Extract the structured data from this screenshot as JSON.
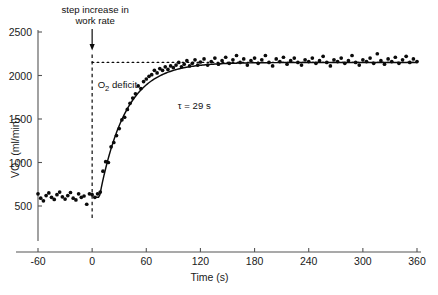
{
  "chart_data": {
    "type": "scatter",
    "title": "",
    "xlabel": "Time (s)",
    "ylabel": "VO2 (ml/min)",
    "ylabel_parts": {
      "main": "VO",
      "subscript": "2",
      "unit": " (ml/min)"
    },
    "xlim": [
      -60,
      360
    ],
    "ylim": [
      350,
      2560
    ],
    "xticks": [
      -60,
      0,
      60,
      120,
      180,
      240,
      300,
      360
    ],
    "xticklabels": [
      "-60",
      "0",
      "60",
      "120",
      "180",
      "240",
      "300",
      "360"
    ],
    "yticks": [
      500,
      1000,
      1500,
      2000,
      2500
    ],
    "yticklabels": [
      "500",
      "1000",
      "1500",
      "2000",
      "2500"
    ],
    "grid": false,
    "legend": false,
    "baseline_vo2": 600,
    "asymptote_vo2": 2150,
    "amplitude_vo2": 1550,
    "tau_seconds": 29,
    "time_delay_seconds": 8,
    "onset_time": 0,
    "series": [
      {
        "name": "VO2 breath-by-breath",
        "marker": "filled-circle",
        "color": "#0b0b0b",
        "x": [
          -60,
          -57,
          -54,
          -51,
          -48,
          -45,
          -42,
          -39,
          -36,
          -33,
          -30,
          -27,
          -24,
          -21,
          -18,
          -15,
          -12,
          -9,
          -6,
          -3,
          0,
          3,
          6,
          9,
          12,
          15,
          18,
          21,
          24,
          27,
          30,
          33,
          36,
          39,
          42,
          45,
          48,
          51,
          54,
          57,
          60,
          63,
          66,
          69,
          72,
          75,
          78,
          81,
          84,
          87,
          90,
          93,
          96,
          99,
          102,
          105,
          108,
          111,
          114,
          117,
          120,
          124,
          128,
          132,
          136,
          140,
          144,
          148,
          152,
          156,
          160,
          164,
          168,
          172,
          176,
          180,
          184,
          188,
          192,
          196,
          200,
          204,
          208,
          212,
          216,
          220,
          224,
          228,
          232,
          236,
          240,
          244,
          248,
          252,
          256,
          260,
          264,
          268,
          272,
          276,
          280,
          284,
          288,
          292,
          296,
          300,
          304,
          308,
          312,
          316,
          320,
          324,
          328,
          332,
          336,
          340,
          344,
          348,
          352,
          356,
          360
        ],
        "y": [
          640,
          590,
          560,
          620,
          650,
          600,
          575,
          630,
          660,
          605,
          580,
          620,
          655,
          590,
          570,
          640,
          600,
          615,
          520,
          640,
          630,
          600,
          640,
          660,
          900,
          1010,
          1000,
          1180,
          1230,
          1310,
          1390,
          1490,
          1520,
          1610,
          1680,
          1740,
          1790,
          1880,
          1850,
          1930,
          1960,
          1990,
          2010,
          2060,
          2030,
          2080,
          2060,
          2100,
          2070,
          2110,
          2090,
          2120,
          2150,
          2100,
          2130,
          2170,
          2110,
          2140,
          2180,
          2120,
          2155,
          2190,
          2120,
          2160,
          2200,
          2130,
          2170,
          2210,
          2140,
          2180,
          2230,
          2150,
          2190,
          2120,
          2170,
          2200,
          2140,
          2180,
          2230,
          2150,
          2110,
          2190,
          2160,
          2210,
          2130,
          2170,
          2200,
          2150,
          2120,
          2180,
          2160,
          2200,
          2140,
          2170,
          2220,
          2150,
          2110,
          2180,
          2160,
          2200,
          2140,
          2170,
          2230,
          2150,
          2120,
          2180,
          2160,
          2200,
          2140,
          2250,
          2170,
          2130,
          2190,
          2160,
          2210,
          2140,
          2180,
          2220,
          2150,
          2190,
          2160
        ]
      }
    ],
    "annotations": [
      {
        "name": "step-increase-label",
        "text_line1": "step increase in",
        "text_line2": "work rate",
        "x": 0,
        "y": 2560
      },
      {
        "name": "o2-deficit-label",
        "text": "O2 deficit",
        "text_main": "O",
        "text_sub": "2",
        "text_rest": " deficit",
        "x": 5,
        "y": 1900
      },
      {
        "name": "tau-label",
        "text": "τ = 29 s",
        "x": 95,
        "y": 1620
      }
    ],
    "reference_lines": [
      {
        "name": "asymptote-line",
        "orientation": "horizontal",
        "value": 2150,
        "style": "dotted",
        "from": 0,
        "to": 360
      },
      {
        "name": "onset-line",
        "orientation": "vertical",
        "value": 0,
        "style": "dashed",
        "from": 350,
        "to": 2240
      }
    ]
  }
}
